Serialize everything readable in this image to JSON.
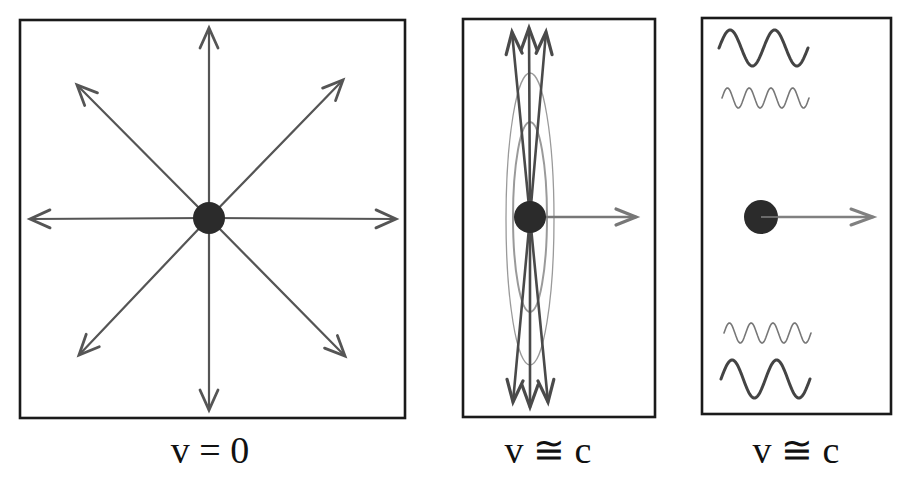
{
  "colors": {
    "background": "#ffffff",
    "frame": "#1a1a1a",
    "arrow": "#555555",
    "charge": "#2b2b2b",
    "ellipse": "#9a9a9a",
    "wave_dark": "#444444",
    "wave_light": "#777777"
  },
  "panels": [
    {
      "id": "rest",
      "caption": "v = 0",
      "frame": {
        "x": 20,
        "y": 20,
        "w": 385,
        "h": 398
      },
      "charge": {
        "cx": 209,
        "cy": 218,
        "r": 16
      },
      "arrows": [
        {
          "direction": "up",
          "x2": 209,
          "y2": 28
        },
        {
          "direction": "down",
          "x2": 209,
          "y2": 410
        },
        {
          "direction": "left",
          "x2": 30,
          "y2": 219
        },
        {
          "direction": "right",
          "x2": 396,
          "y2": 219
        },
        {
          "direction": "up-left",
          "x2": 77,
          "y2": 85
        },
        {
          "direction": "up-right",
          "x2": 343,
          "y2": 80
        },
        {
          "direction": "down-left",
          "x2": 79,
          "y2": 355
        },
        {
          "direction": "down-right",
          "x2": 345,
          "y2": 356
        }
      ]
    },
    {
      "id": "relativistic-beamed",
      "caption": "v ≅ c",
      "frame": {
        "x": 463,
        "y": 19,
        "w": 192,
        "h": 398
      },
      "charge": {
        "cx": 530,
        "cy": 217,
        "r": 16
      },
      "velocity_arrow": {
        "x2": 636,
        "y2": 217
      },
      "arrows": [
        {
          "direction": "up",
          "x2": 512,
          "y2": 32
        },
        {
          "direction": "up",
          "x2": 529,
          "y2": 28
        },
        {
          "direction": "up",
          "x2": 546,
          "y2": 32
        },
        {
          "direction": "down",
          "x2": 513,
          "y2": 402
        },
        {
          "direction": "down",
          "x2": 530,
          "y2": 407
        },
        {
          "direction": "down",
          "x2": 548,
          "y2": 402
        }
      ],
      "ellipses": [
        {
          "cx": 530,
          "cy": 219,
          "rx": 24,
          "ry": 146
        },
        {
          "cx": 530,
          "cy": 217,
          "rx": 17,
          "ry": 95
        }
      ]
    },
    {
      "id": "relativistic-waves",
      "caption": "v ≅ c",
      "frame": {
        "x": 702,
        "y": 18,
        "w": 189,
        "h": 396
      },
      "charge": {
        "cx": 761,
        "cy": 217,
        "r": 17
      },
      "velocity_arrow": {
        "x2": 873,
        "y2": 217
      },
      "waves": [
        {
          "position": "top-long",
          "x": 719,
          "y": 48,
          "length": 89,
          "amplitude": 18,
          "cycles": 2,
          "stroke": 3
        },
        {
          "position": "top-short",
          "x": 722,
          "y": 98,
          "length": 87,
          "amplitude": 10,
          "cycles": 4,
          "stroke": 1.6
        },
        {
          "position": "bottom-short",
          "x": 724,
          "y": 333,
          "length": 87,
          "amplitude": 10,
          "cycles": 4,
          "stroke": 1.6
        },
        {
          "position": "bottom-long",
          "x": 721,
          "y": 379,
          "length": 89,
          "amplitude": 19,
          "cycles": 2,
          "stroke": 3
        }
      ]
    }
  ],
  "captions": [
    {
      "text": "v = 0",
      "x": 210
    },
    {
      "text": "v ≅ c",
      "x": 548
    },
    {
      "text": "v ≅ c",
      "x": 796
    }
  ]
}
